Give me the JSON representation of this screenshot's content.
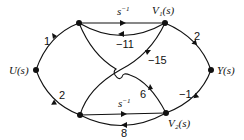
{
  "diagram": {
    "type": "signal-flow-graph",
    "nodes": {
      "input": {
        "label": "U(s)"
      },
      "n1": {
        "label": ""
      },
      "v1": {
        "label": "V₁(s)"
      },
      "output": {
        "label": "Y(s)"
      },
      "n2": {
        "label": ""
      },
      "v2": {
        "label": "V₂(s)"
      }
    },
    "edges": {
      "u_to_n1": {
        "from": "U(s)",
        "to": "n1",
        "gain": "1"
      },
      "u_to_n2": {
        "from": "U(s)",
        "to": "n2",
        "gain": "2"
      },
      "n1_to_v1": {
        "from": "n1",
        "to": "V1(s)",
        "gain": "s",
        "gain_sup": "−1"
      },
      "v1_to_n1": {
        "from": "V1(s)",
        "to": "n1",
        "gain": "−11"
      },
      "v1_to_n2": {
        "from": "V1(s)",
        "to": "n2",
        "gain": "−15"
      },
      "v2_to_n1": {
        "from": "V2(s)",
        "to": "n1",
        "gain": "6"
      },
      "v1_to_y": {
        "from": "V1(s)",
        "to": "Y(s)",
        "gain": "2"
      },
      "v2_to_y": {
        "from": "V2(s)",
        "to": "Y(s)",
        "gain": "−1"
      },
      "n2_to_v2": {
        "from": "n2",
        "to": "V2(s)",
        "gain": "s",
        "gain_sup": "−1"
      },
      "v2_to_n2": {
        "from": "V2(s)",
        "to": "n2",
        "gain": "8"
      }
    }
  }
}
